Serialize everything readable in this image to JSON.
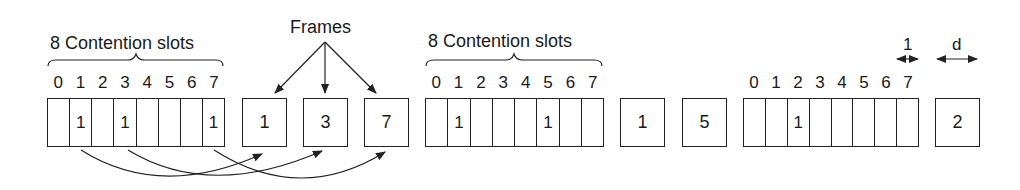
{
  "title_labels": {
    "contention_group1": "8 Contention slots",
    "contention_group2": "8 Contention slots",
    "frames": "Frames",
    "slot_width_label": "1",
    "frame_width_label": "d"
  },
  "slot_indices": [
    "0",
    "1",
    "2",
    "3",
    "4",
    "5",
    "6",
    "7"
  ],
  "groups": [
    {
      "slots": [
        "",
        "1",
        "",
        "1",
        "",
        "",
        "",
        "1"
      ],
      "frames": [
        "1",
        "3",
        "7"
      ]
    },
    {
      "slots": [
        "",
        "1",
        "",
        "",
        "",
        "1",
        "",
        ""
      ],
      "frames": [
        "1",
        "5"
      ]
    },
    {
      "slots": [
        "",
        "",
        "1",
        "",
        "",
        "",
        "",
        ""
      ],
      "frames": [
        "2"
      ]
    }
  ]
}
